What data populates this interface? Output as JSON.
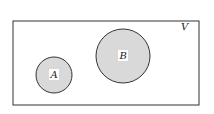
{
  "diagram": {
    "type": "venn",
    "universe": {
      "label": "V",
      "rect": {
        "x": 13,
        "y": 21,
        "width": 186,
        "height": 84
      },
      "fill": "#ffffff",
      "stroke": "#333333"
    },
    "sets": [
      {
        "label": "A",
        "cx": 54,
        "cy": 75,
        "r": 18,
        "fill": "#d9d9d9",
        "stroke": "#333333"
      },
      {
        "label": "B",
        "cx": 123,
        "cy": 56,
        "r": 27,
        "fill": "#d9d9d9",
        "stroke": "#333333"
      }
    ],
    "relationship": "disjoint"
  }
}
